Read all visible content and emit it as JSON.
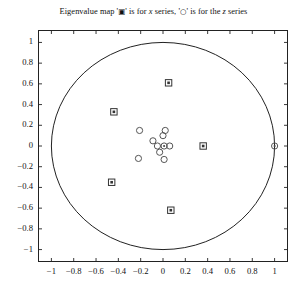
{
  "chart_data": {
    "type": "scatter",
    "title": "Eigenvalue map '▣' is for x series, '○' is for the z series",
    "title_prefix": "Eigenvalue map '",
    "title_mid": "' is for ",
    "title_x_italic": "x",
    "title_mid2": " series, '",
    "title_mid3": "' is for the ",
    "title_z_italic": "z",
    "title_suffix": " series",
    "marker_x_glyph": "▣",
    "marker_z_glyph": "○",
    "xlabel": "",
    "ylabel": "",
    "xlim": [
      -1.12,
      1.12
    ],
    "ylim": [
      -1.12,
      1.12
    ],
    "grid": false,
    "legend": "in-title",
    "annotations": [
      {
        "name": "unit-circle",
        "type": "circle",
        "cx": 0,
        "cy": 0,
        "r": 1
      }
    ],
    "xticks": [
      -1,
      -0.8,
      -0.6,
      -0.4,
      -0.2,
      0,
      0.2,
      0.4,
      0.6,
      0.8,
      1
    ],
    "xticklabels": [
      "-1",
      "-0.8",
      "-0.6",
      "-0.4",
      "-0.2",
      "0",
      "0.2",
      "0.4",
      "0.6",
      "0.8",
      "1"
    ],
    "yticks": [
      -1,
      -0.8,
      -0.6,
      -0.4,
      -0.2,
      0,
      0.2,
      0.4,
      0.6,
      0.8,
      1
    ],
    "yticklabels": [
      "-1",
      "-0.8",
      "-0.6",
      "-0.4",
      "-0.2",
      "0",
      "0.2",
      "0.4",
      "0.6",
      "0.8",
      "1"
    ],
    "series": [
      {
        "name": "x series",
        "marker": "square",
        "points": [
          [
            0.05,
            0.61
          ],
          [
            -0.44,
            0.33
          ],
          [
            -0.46,
            -0.35
          ],
          [
            0.07,
            -0.62
          ],
          [
            0.36,
            0.0
          ]
        ]
      },
      {
        "name": "z series",
        "marker": "circle",
        "points": [
          [
            -0.21,
            0.15
          ],
          [
            -0.09,
            0.05
          ],
          [
            0.0,
            0.1
          ],
          [
            0.02,
            0.15
          ],
          [
            0.01,
            0.0
          ],
          [
            0.06,
            0.0
          ],
          [
            -0.05,
            0.0
          ],
          [
            -0.03,
            -0.06
          ],
          [
            0.01,
            -0.13
          ],
          [
            -0.22,
            -0.12
          ],
          [
            1.0,
            0.0
          ]
        ]
      }
    ]
  }
}
